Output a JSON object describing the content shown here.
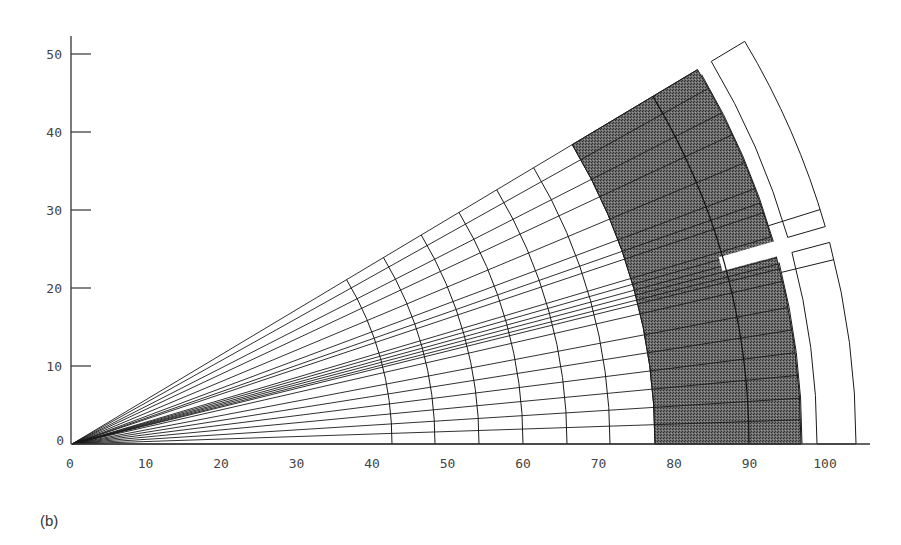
{
  "figure": {
    "panel_label": "(b)",
    "x_axis": {
      "ticks": [
        "0",
        "10",
        "20",
        "30",
        "40",
        "50",
        "60",
        "70",
        "80",
        "90",
        "100"
      ]
    },
    "y_axis": {
      "ticks": [
        "0",
        "10",
        "20",
        "30",
        "40",
        "50"
      ]
    },
    "colors": {
      "line": "#1a1a1a",
      "shade": "#5a5a5a",
      "background": "#ffffff"
    },
    "geometry": {
      "apex_px": [
        72,
        444
      ],
      "sector_angle_deg": 30,
      "mesh_arc_radii_px": [
        320,
        363,
        407,
        451,
        495,
        538
      ],
      "mesh_outer_radius_px": 583,
      "ray_angles_deg": [
        0,
        1.9,
        3.6,
        5.4,
        7.2,
        9.0,
        10.8,
        12.9,
        13.9,
        14.3,
        14.8,
        15.3,
        15.9,
        16.5,
        18.5,
        19.3,
        20.5,
        22.7,
        25.1,
        27.0,
        29.2,
        30.9
      ],
      "shaded_band_px": {
        "inner": 583,
        "mid": 677,
        "outer": 729
      },
      "slit_deg": [
        14.9,
        16.1
      ],
      "outer_boxes": [
        {
          "name": "upper-box",
          "r_in": 745,
          "r_out": 784,
          "a0": 16.1,
          "a1": 30.9,
          "divider_deg": 17.4
        },
        {
          "name": "lower-box",
          "r_in": 745,
          "r_out": 784,
          "a0": 0,
          "a1": 14.9,
          "divider_deg": 13.6
        }
      ]
    }
  }
}
